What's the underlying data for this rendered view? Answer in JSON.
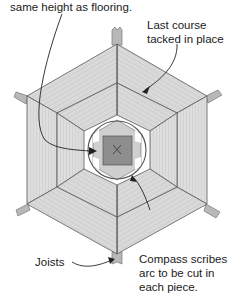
{
  "diagram": {
    "labels": {
      "top_left": "same height as flooring.",
      "last_course": "Last course\ntacked in place",
      "joists": "Joists",
      "compass": "Compass scribes\narc to be cut in\neach piece."
    },
    "colors": {
      "board": "#dcdcdc",
      "board_dark": "#c8c8c8",
      "joist": "#b4b4b4",
      "center_square": "#8c8c8c",
      "line": "#555555",
      "text": "#1a1a1a"
    }
  }
}
